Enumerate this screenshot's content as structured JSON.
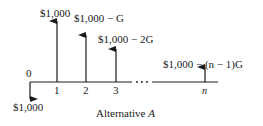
{
  "diagram": {
    "type": "cash-flow-diagram",
    "caption": "Alternative A",
    "caption_prefix": "Alternative ",
    "caption_var": "A",
    "origin_label": "0",
    "outflow": {
      "period": "0",
      "amount": "$1,000",
      "direction": "down"
    },
    "inflows": [
      {
        "period": "1",
        "amount": "$1,000",
        "direction": "up"
      },
      {
        "period": "2",
        "amount": "$1,000 − G",
        "direction": "up"
      },
      {
        "period": "3",
        "amount": "$1,000 − 2G",
        "direction": "up"
      },
      {
        "period": "n",
        "amount": "$1,000 − (n − 1)G",
        "direction": "up"
      }
    ],
    "ellipsis": "· · ·",
    "tick_labels": [
      "1",
      "2",
      "3",
      "n"
    ]
  }
}
